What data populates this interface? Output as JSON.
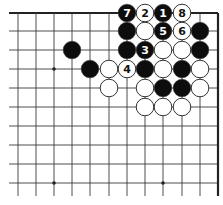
{
  "diagram": {
    "type": "go-board-fragment",
    "grid": {
      "columns_x": [
        18,
        36,
        54,
        72,
        90,
        109,
        127,
        145,
        163,
        182,
        200,
        218
      ],
      "rows_y": [
        13,
        31,
        50,
        69,
        88,
        107,
        126,
        145,
        164,
        183
      ],
      "left_x": 9,
      "bottom_y": 196,
      "top_edge": true,
      "right_edge": true
    },
    "star_points": [
      {
        "col": 2,
        "row": 3
      },
      {
        "col": 2,
        "row": 9
      },
      {
        "col": 8,
        "row": 9
      }
    ],
    "stones": [
      {
        "color": "black",
        "col": 6,
        "row": 0,
        "label": "7"
      },
      {
        "color": "white",
        "col": 7,
        "row": 0,
        "label": "2"
      },
      {
        "color": "black",
        "col": 8,
        "row": 0,
        "label": "1"
      },
      {
        "color": "white",
        "col": 9,
        "row": 0,
        "label": "8"
      },
      {
        "color": "black",
        "col": 6,
        "row": 1,
        "label": ""
      },
      {
        "color": "white",
        "col": 7,
        "row": 1,
        "label": ""
      },
      {
        "color": "black",
        "col": 8,
        "row": 1,
        "label": "5"
      },
      {
        "color": "white",
        "col": 9,
        "row": 1,
        "label": "6"
      },
      {
        "color": "black",
        "col": 10,
        "row": 1,
        "label": ""
      },
      {
        "color": "black",
        "col": 3,
        "row": 2,
        "label": ""
      },
      {
        "color": "black",
        "col": 6,
        "row": 2,
        "label": ""
      },
      {
        "color": "black",
        "col": 7,
        "row": 2,
        "label": "3"
      },
      {
        "color": "white",
        "col": 8,
        "row": 2,
        "label": ""
      },
      {
        "color": "white",
        "col": 9,
        "row": 2,
        "label": ""
      },
      {
        "color": "black",
        "col": 10,
        "row": 2,
        "label": ""
      },
      {
        "color": "black",
        "col": 4,
        "row": 3,
        "label": ""
      },
      {
        "color": "white",
        "col": 5,
        "row": 3,
        "label": ""
      },
      {
        "color": "white",
        "col": 6,
        "row": 3,
        "label": "4"
      },
      {
        "color": "black",
        "col": 7,
        "row": 3,
        "label": ""
      },
      {
        "color": "white",
        "col": 8,
        "row": 3,
        "label": ""
      },
      {
        "color": "black",
        "col": 9,
        "row": 3,
        "label": ""
      },
      {
        "color": "white",
        "col": 10,
        "row": 3,
        "label": ""
      },
      {
        "color": "white",
        "col": 5,
        "row": 4,
        "label": ""
      },
      {
        "color": "white",
        "col": 7,
        "row": 4,
        "label": ""
      },
      {
        "color": "black",
        "col": 8,
        "row": 4,
        "label": ""
      },
      {
        "color": "black",
        "col": 9,
        "row": 4,
        "label": ""
      },
      {
        "color": "white",
        "col": 10,
        "row": 4,
        "label": ""
      },
      {
        "color": "white",
        "col": 7,
        "row": 5,
        "label": ""
      },
      {
        "color": "white",
        "col": 8,
        "row": 5,
        "label": ""
      },
      {
        "color": "white",
        "col": 9,
        "row": 5,
        "label": ""
      }
    ],
    "colors": {
      "line": "#3a3a3a",
      "edge": "#222222",
      "black_stone": "#0d0d0d",
      "white_stone": "#ffffff",
      "stone_outline": "#333333"
    }
  }
}
